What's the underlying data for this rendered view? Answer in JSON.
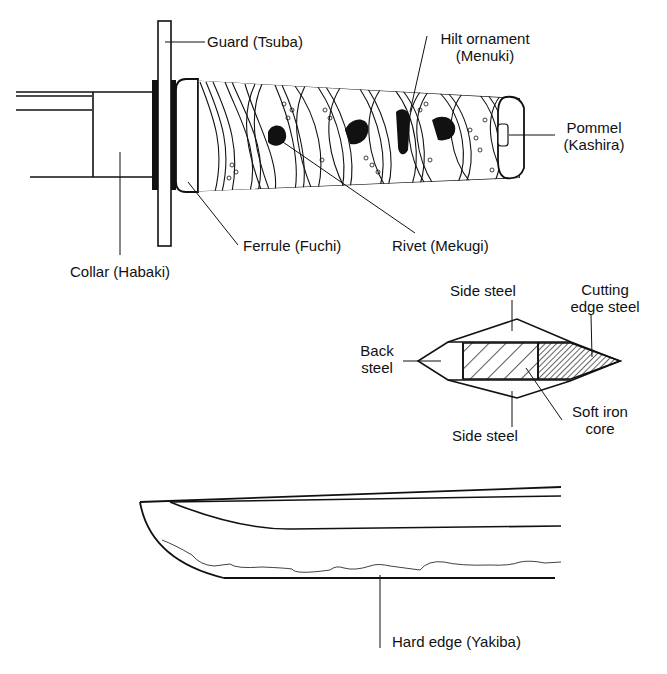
{
  "diagram": {
    "colors": {
      "ink": "#111111",
      "background": "#ffffff"
    },
    "hilt_labels": {
      "guard": "Guard (Tsuba)",
      "hilt_ornament_1": "Hilt ornament",
      "hilt_ornament_2": "(Menuki)",
      "pommel_1": "Pommel",
      "pommel_2": "(Kashira)",
      "ferrule": "Ferrule (Fuchi)",
      "rivet": "Rivet (Mekugi)",
      "collar": "Collar (Habaki)"
    },
    "cross_section_labels": {
      "side_steel_top": "Side steel",
      "cutting_edge_1": "Cutting",
      "cutting_edge_2": "edge steel",
      "back_steel_1": "Back",
      "back_steel_2": "steel",
      "side_steel_bottom": "Side steel",
      "soft_iron_1": "Soft iron",
      "soft_iron_2": "core"
    },
    "blade_labels": {
      "hard_edge": "Hard edge (Yakiba)"
    }
  }
}
